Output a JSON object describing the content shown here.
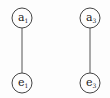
{
  "diagram": {
    "nodes": [
      {
        "id": "a1",
        "base": "a",
        "sub": "1",
        "cx": 22,
        "cy": 18
      },
      {
        "id": "a3",
        "base": "a",
        "sub": "3",
        "cx": 90,
        "cy": 18
      },
      {
        "id": "e1",
        "base": "e",
        "sub": "1",
        "cx": 22,
        "cy": 83
      },
      {
        "id": "e3",
        "base": "e",
        "sub": "3",
        "cx": 90,
        "cy": 83
      }
    ],
    "edges": [
      {
        "from": "a1",
        "to": "e1"
      },
      {
        "from": "a3",
        "to": "e3"
      }
    ],
    "colors": {
      "stroke": "#444444",
      "background": "#fdfdfd"
    }
  }
}
